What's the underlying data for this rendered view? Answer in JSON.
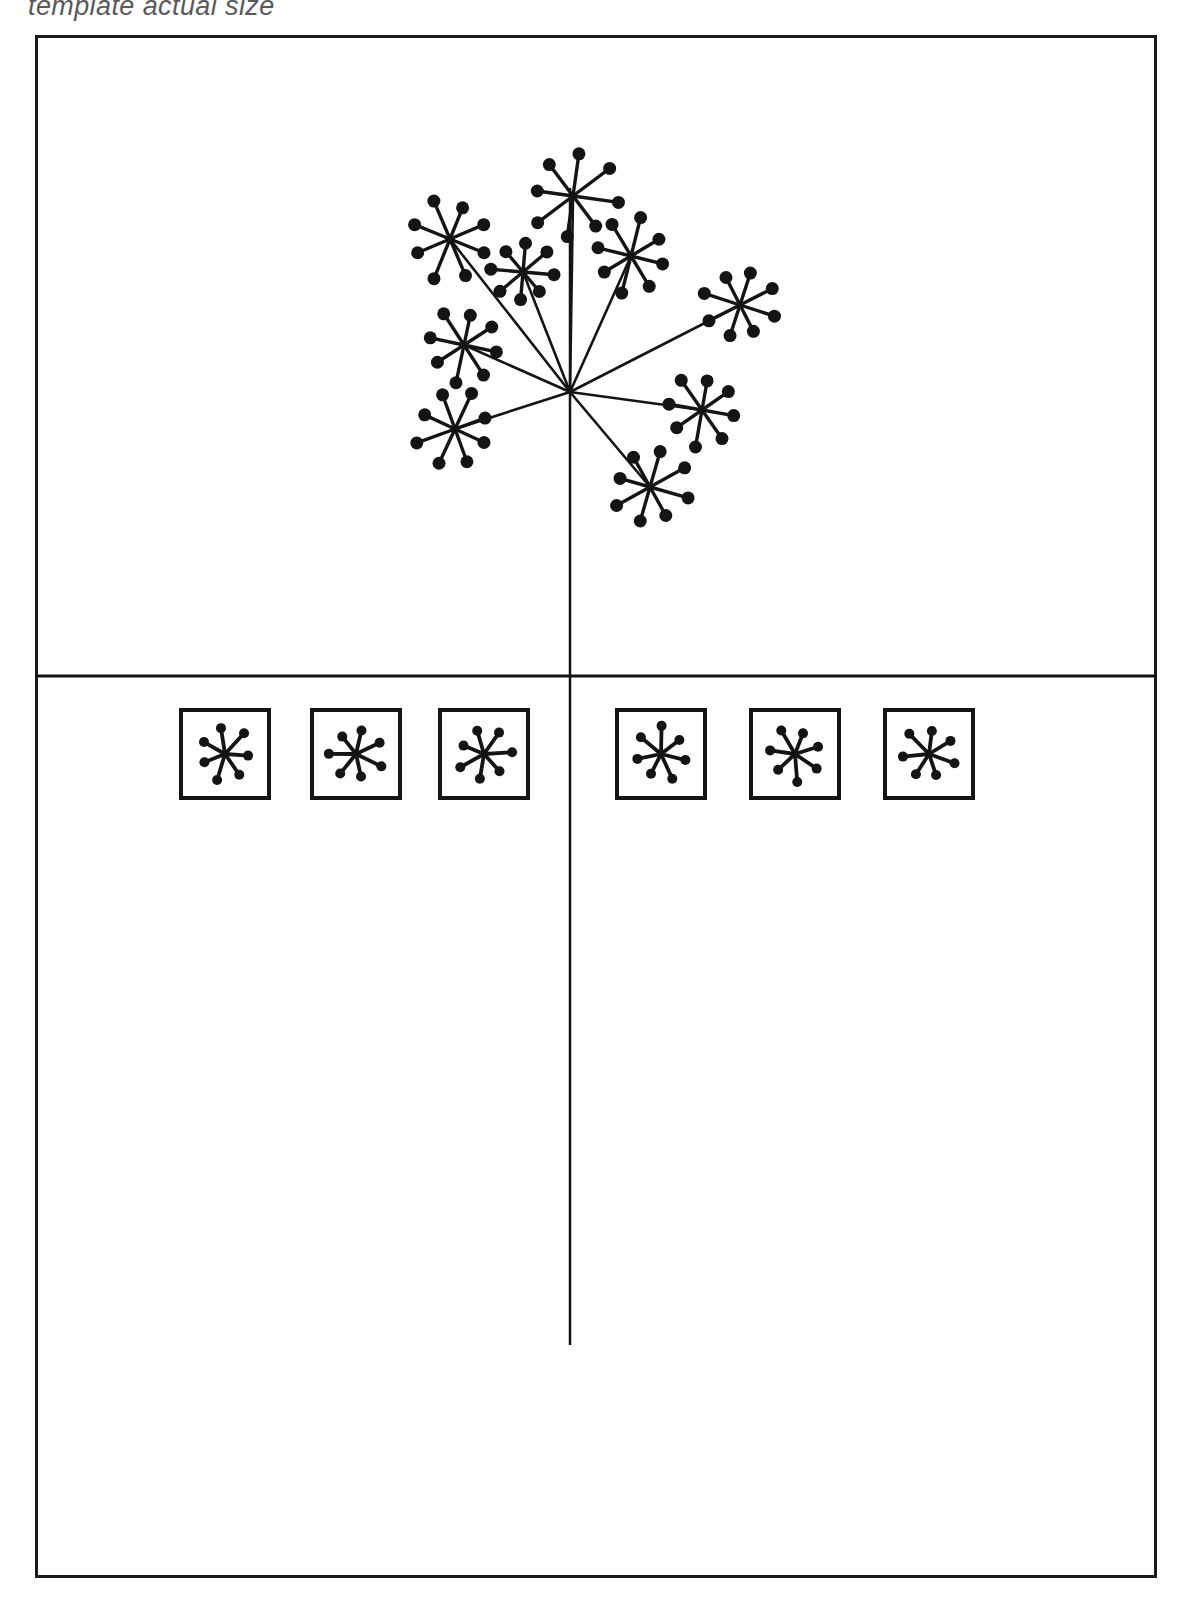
{
  "caption": {
    "text": "template actual size"
  },
  "frame": {
    "x": 35,
    "y": 35,
    "width": 1122,
    "height": 1543,
    "stroke_color": "#1a1a1a",
    "stroke_width": 3,
    "fill": "#ffffff"
  },
  "divider": {
    "name": "horizontal-divider",
    "y": 676,
    "x1": 35,
    "x2": 1157,
    "stroke_width": 3
  },
  "stem": {
    "name": "vertical-stem-line",
    "x": 570,
    "y_top": 188,
    "y_bottom": 1345,
    "stroke_width": 2.5
  },
  "umbel": {
    "name": "umbel-flower-diagram",
    "hub": {
      "x": 570,
      "y": 392
    },
    "ray_count": 9,
    "floret_ray_count": 8,
    "dot_radius": 6.5,
    "small_dot_radius": 5.2,
    "stroke_color": "#141414",
    "florets": [
      {
        "label": "floret-top",
        "x": 573,
        "y": 196,
        "r": 44,
        "rot": 8
      },
      {
        "label": "floret-upper-left",
        "x": 450,
        "y": 239,
        "r": 41,
        "rot": 22
      },
      {
        "label": "floret-upper-right",
        "x": 631,
        "y": 256,
        "r": 38,
        "rot": 14
      },
      {
        "label": "floret-inner-left",
        "x": 523,
        "y": 272,
        "r": 31,
        "rot": 5
      },
      {
        "label": "floret-right",
        "x": 740,
        "y": 305,
        "r": 36,
        "rot": 18
      },
      {
        "label": "floret-mid-left",
        "x": 464,
        "y": 345,
        "r": 37,
        "rot": 12
      },
      {
        "label": "floret-lower-left",
        "x": 455,
        "y": 429,
        "r": 39,
        "rot": 25
      },
      {
        "label": "floret-lower-right",
        "x": 702,
        "y": 410,
        "r": 36,
        "rot": 10
      },
      {
        "label": "floret-bottom-right",
        "x": 650,
        "y": 487,
        "r": 38,
        "rot": 16
      }
    ]
  },
  "swatch_row": {
    "name": "motif-swatch-row",
    "box_size": 88,
    "box_y": 710,
    "box_stroke_width": 4,
    "motif_ray_count": 7,
    "motif_radius": 27,
    "motif_dot_radius": 5,
    "boxes": [
      {
        "label": "swatch-box-1",
        "x": 181,
        "rot": 4
      },
      {
        "label": "swatch-box-2",
        "x": 312,
        "rot": 26
      },
      {
        "label": "swatch-box-3",
        "x": 440,
        "rot": 48
      },
      {
        "label": "swatch-box-4",
        "x": 617,
        "rot": 14
      },
      {
        "label": "swatch-box-5",
        "x": 751,
        "rot": 34
      },
      {
        "label": "swatch-box-6",
        "x": 885,
        "rot": 20
      }
    ]
  },
  "colors": {
    "ink": "#141414",
    "paper": "#ffffff",
    "caption_gray": "#5a5a5a"
  }
}
